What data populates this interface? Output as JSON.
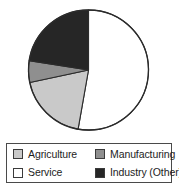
{
  "chart_data": {
    "type": "pie",
    "title": "",
    "subtitle": "",
    "xlabel": "",
    "ylabel": "",
    "legend_position": "bottom",
    "grid": false,
    "start_angle_deg": 0,
    "direction": "clockwise",
    "categories": [
      "Service",
      "Agriculture",
      "Manufacturing",
      "Industry (Other)"
    ],
    "values": [
      53,
      19,
      6,
      22
    ],
    "units": "percent",
    "slices": [
      {
        "label": "Service",
        "value": 53,
        "color": "#ffffff",
        "start_deg": 0,
        "end_deg": 190
      },
      {
        "label": "Agriculture",
        "value": 19,
        "color": "#c9c9c9",
        "start_deg": 190,
        "end_deg": 258
      },
      {
        "label": "Manufacturing",
        "value": 6,
        "color": "#8f8f8f",
        "start_deg": 258,
        "end_deg": 279
      },
      {
        "label": "Industry (Other)",
        "value": 22,
        "color": "#262626",
        "start_deg": 279,
        "end_deg": 360
      }
    ],
    "legend_entries": [
      {
        "label": "Agriculture",
        "color": "#c9c9c9"
      },
      {
        "label": "Manufacturing",
        "color": "#8f8f8f"
      },
      {
        "label": "Service",
        "color": "#ffffff"
      },
      {
        "label": "Industry (Other)",
        "color": "#262626"
      }
    ]
  },
  "legend": {
    "agriculture_label": "Agriculture",
    "manufacturing_label": "Manufacturing",
    "service_label": "Service",
    "industry_label": "Industry (Other)"
  },
  "colors": {
    "agriculture": "#c9c9c9",
    "manufacturing": "#8f8f8f",
    "service": "#ffffff",
    "industry_other": "#262626",
    "outline": "#2b2b2b",
    "legend_border": "#4a4a4a",
    "text": "#1d1d1d",
    "background": "#ffffff"
  }
}
